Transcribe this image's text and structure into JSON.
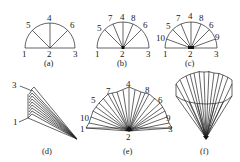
{
  "figure": {
    "panels": [
      {
        "id": "a",
        "caption": "(a)",
        "labels": {
          "base_left": "1",
          "center": "2",
          "base_right": "3",
          "arc": [
            "5",
            "4",
            "6"
          ]
        }
      },
      {
        "id": "b",
        "caption": "(b)",
        "labels": {
          "base_left": "1",
          "center": "2",
          "base_right": "3",
          "arc": [
            "5",
            "7",
            "4",
            "8",
            "6"
          ]
        }
      },
      {
        "id": "c",
        "caption": "(c)",
        "labels": {
          "base_left": "1",
          "center": "2",
          "base_right": "3",
          "arc": [
            "10",
            "5",
            "7",
            "4",
            "8",
            "6",
            "9"
          ]
        }
      },
      {
        "id": "d",
        "caption": "(d)",
        "labels": {
          "top": "3",
          "bottom": "1"
        }
      },
      {
        "id": "e",
        "caption": "(e)",
        "labels": {
          "base_left": "1",
          "center": "2",
          "base_right": "3",
          "arc": [
            "10",
            "5",
            "7",
            "4",
            "8",
            "6",
            "9"
          ]
        }
      },
      {
        "id": "f",
        "caption": "(f)",
        "labels": {}
      }
    ]
  }
}
